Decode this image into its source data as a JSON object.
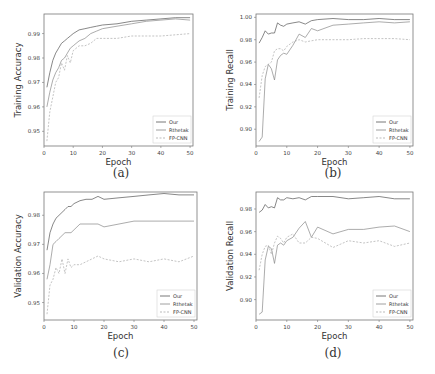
{
  "captions": [
    "(a)",
    "(b)",
    "(c)",
    "(d)"
  ],
  "legend": [
    "Our",
    "Rthetak",
    "FP-CNN"
  ],
  "series_colors": [
    "#555555",
    "#888888",
    "#aaaaaa"
  ],
  "chart_data": [
    {
      "type": "line",
      "title": "",
      "xlabel": "Epoch",
      "ylabel": "Training Accuracy",
      "xlim": [
        0,
        51
      ],
      "ylim": [
        0.944,
        0.998
      ],
      "xticks": [
        0,
        10,
        20,
        30,
        40,
        50
      ],
      "yticks": [
        0.95,
        0.96,
        0.97,
        0.98,
        0.99
      ],
      "ytick_labels": [
        "0.95",
        "0.96",
        "0.97",
        "0.98",
        "0.99"
      ],
      "legend_position": "lower right",
      "x": [
        1,
        2,
        3,
        4,
        5,
        6,
        7,
        8,
        9,
        10,
        12,
        14,
        16,
        18,
        20,
        25,
        30,
        35,
        40,
        45,
        50
      ],
      "series": [
        {
          "name": "Our",
          "values": [
            0.968,
            0.974,
            0.979,
            0.982,
            0.984,
            0.986,
            0.987,
            0.988,
            0.989,
            0.99,
            0.9915,
            0.992,
            0.9925,
            0.993,
            0.9935,
            0.994,
            0.995,
            0.9955,
            0.996,
            0.9965,
            0.9965
          ]
        },
        {
          "name": "Rthetak",
          "values": [
            0.96,
            0.966,
            0.971,
            0.974,
            0.976,
            0.979,
            0.98,
            0.982,
            0.984,
            0.985,
            0.987,
            0.988,
            0.99,
            0.991,
            0.992,
            0.993,
            0.994,
            0.995,
            0.9955,
            0.996,
            0.9955
          ]
        },
        {
          "name": "FP-CNN",
          "values": [
            0.946,
            0.958,
            0.964,
            0.97,
            0.972,
            0.978,
            0.975,
            0.981,
            0.978,
            0.983,
            0.985,
            0.985,
            0.986,
            0.988,
            0.988,
            0.988,
            0.989,
            0.989,
            0.989,
            0.9895,
            0.99
          ]
        }
      ]
    },
    {
      "type": "line",
      "title": "",
      "xlabel": "Epoch",
      "ylabel": "Training Recall",
      "xlim": [
        0,
        51
      ],
      "ylim": [
        0.885,
        1.003
      ],
      "xticks": [
        0,
        10,
        20,
        30,
        40,
        50
      ],
      "yticks": [
        0.9,
        0.92,
        0.94,
        0.96,
        0.98,
        1.0
      ],
      "ytick_labels": [
        "0.90",
        "0.92",
        "0.94",
        "0.96",
        "0.98",
        "1.00"
      ],
      "legend_position": "lower right",
      "x": [
        1,
        2,
        3,
        4,
        5,
        6,
        7,
        8,
        9,
        10,
        12,
        14,
        16,
        18,
        20,
        25,
        30,
        35,
        40,
        45,
        50
      ],
      "series": [
        {
          "name": "Our",
          "values": [
            0.977,
            0.982,
            0.988,
            0.985,
            0.986,
            0.986,
            0.995,
            0.993,
            0.992,
            0.994,
            0.995,
            0.996,
            0.994,
            0.997,
            0.998,
            0.999,
            0.998,
            0.998,
            0.999,
            0.998,
            0.998
          ]
        },
        {
          "name": "Rthetak",
          "values": [
            0.889,
            0.893,
            0.945,
            0.958,
            0.954,
            0.944,
            0.962,
            0.966,
            0.968,
            0.967,
            0.975,
            0.985,
            0.982,
            0.99,
            0.988,
            0.993,
            0.994,
            0.995,
            0.996,
            0.995,
            0.996
          ]
        },
        {
          "name": "FP-CNN",
          "values": [
            0.928,
            0.948,
            0.956,
            0.958,
            0.96,
            0.97,
            0.972,
            0.972,
            0.97,
            0.974,
            0.978,
            0.98,
            0.978,
            0.979,
            0.98,
            0.98,
            0.98,
            0.981,
            0.981,
            0.981,
            0.98
          ]
        }
      ]
    },
    {
      "type": "line",
      "title": "",
      "xlabel": "Epoch",
      "ylabel": "Validation Accuracy",
      "xlim": [
        0,
        51
      ],
      "ylim": [
        0.944,
        0.988
      ],
      "xticks": [
        0,
        10,
        20,
        30,
        40,
        50
      ],
      "yticks": [
        0.95,
        0.96,
        0.97,
        0.98
      ],
      "ytick_labels": [
        "0.95",
        "0.96",
        "0.97",
        "0.98"
      ],
      "legend_position": "lower right",
      "x": [
        1,
        2,
        3,
        4,
        5,
        6,
        7,
        8,
        9,
        10,
        12,
        14,
        16,
        18,
        20,
        25,
        30,
        35,
        40,
        45,
        50
      ],
      "series": [
        {
          "name": "Our",
          "values": [
            0.968,
            0.974,
            0.977,
            0.979,
            0.98,
            0.981,
            0.982,
            0.983,
            0.983,
            0.984,
            0.985,
            0.9855,
            0.9855,
            0.9865,
            0.9855,
            0.986,
            0.9865,
            0.987,
            0.9875,
            0.987,
            0.987
          ]
        },
        {
          "name": "Rthetak",
          "values": [
            0.958,
            0.963,
            0.97,
            0.971,
            0.972,
            0.973,
            0.974,
            0.974,
            0.974,
            0.975,
            0.977,
            0.977,
            0.977,
            0.977,
            0.976,
            0.977,
            0.978,
            0.978,
            0.978,
            0.978,
            0.978
          ]
        },
        {
          "name": "FP-CNN",
          "values": [
            0.946,
            0.956,
            0.958,
            0.962,
            0.96,
            0.965,
            0.96,
            0.965,
            0.962,
            0.963,
            0.963,
            0.964,
            0.965,
            0.966,
            0.965,
            0.964,
            0.965,
            0.964,
            0.965,
            0.964,
            0.966
          ]
        }
      ]
    },
    {
      "type": "line",
      "title": "",
      "xlabel": "Epoch",
      "ylabel": "Validation Recall",
      "xlim": [
        0,
        51
      ],
      "ylim": [
        0.882,
        0.995
      ],
      "xticks": [
        0,
        10,
        20,
        30,
        40,
        50
      ],
      "yticks": [
        0.9,
        0.92,
        0.94,
        0.96,
        0.98
      ],
      "ytick_labels": [
        "0.90",
        "0.92",
        "0.94",
        "0.96",
        "0.98"
      ],
      "legend_position": "lower right",
      "x": [
        1,
        2,
        3,
        4,
        5,
        6,
        7,
        8,
        9,
        10,
        12,
        14,
        16,
        18,
        20,
        25,
        30,
        35,
        40,
        45,
        50
      ],
      "series": [
        {
          "name": "Our",
          "values": [
            0.977,
            0.979,
            0.984,
            0.981,
            0.982,
            0.981,
            0.99,
            0.988,
            0.988,
            0.99,
            0.989,
            0.99,
            0.988,
            0.991,
            0.991,
            0.991,
            0.989,
            0.99,
            0.991,
            0.989,
            0.989
          ]
        },
        {
          "name": "Rthetak",
          "values": [
            0.887,
            0.889,
            0.935,
            0.947,
            0.945,
            0.932,
            0.948,
            0.95,
            0.948,
            0.952,
            0.955,
            0.963,
            0.969,
            0.955,
            0.964,
            0.958,
            0.962,
            0.962,
            0.964,
            0.965,
            0.96
          ]
        },
        {
          "name": "FP-CNN",
          "values": [
            0.926,
            0.94,
            0.947,
            0.948,
            0.94,
            0.95,
            0.956,
            0.954,
            0.95,
            0.955,
            0.958,
            0.95,
            0.95,
            0.955,
            0.954,
            0.946,
            0.952,
            0.95,
            0.952,
            0.947,
            0.95
          ]
        }
      ]
    }
  ]
}
